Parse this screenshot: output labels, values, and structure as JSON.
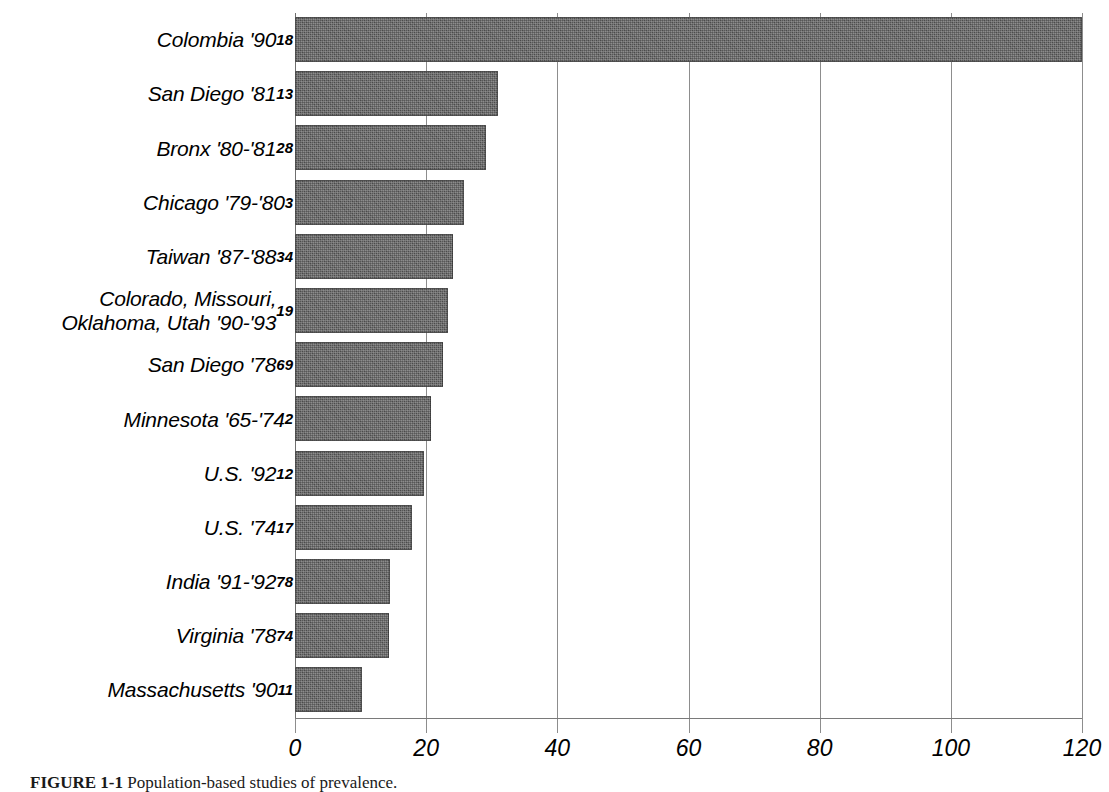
{
  "figure": {
    "caption_label": "FIGURE 1-1",
    "caption_text": "Population-based studies of prevalence."
  },
  "axis": {
    "tick_labels": [
      "0",
      "20",
      "40",
      "60",
      "80",
      "100",
      "120"
    ],
    "tick_values": [
      0,
      20,
      40,
      60,
      80,
      100,
      120
    ],
    "xlabel": ""
  },
  "colors": {
    "bar_fill": "#585858",
    "gridline": "#8d8d8d",
    "axis": "#7a7a7a",
    "text": "#000000",
    "background": "#ffffff"
  },
  "chart_data": {
    "type": "bar",
    "orientation": "horizontal",
    "title": "",
    "xlabel": "",
    "ylabel": "",
    "xlim": [
      0,
      120
    ],
    "grid": true,
    "legend": "none",
    "categories": [
      "Colombia '90",
      "San Diego '81",
      "Bronx '80-'81",
      "Chicago '79-'80",
      "Taiwan '87-'88",
      "Colorado, Missouri,\nOklahoma, Utah '90-'93",
      "San Diego '78",
      "Minnesota '65-'74",
      "U.S. '92",
      "U.S. '74",
      "India '91-'92",
      "Virginia '78",
      "Massachusetts '90"
    ],
    "reference_superscripts": [
      "18",
      "13",
      "28",
      "3",
      "34",
      "19",
      "69",
      "2",
      "12",
      "17",
      "78",
      "74",
      "11"
    ],
    "values": [
      120,
      30.9,
      29.1,
      25.7,
      24.1,
      23.4,
      22.6,
      20.8,
      19.7,
      17.8,
      14.5,
      14.3,
      10.2
    ]
  },
  "rows": [
    {
      "label": "Colombia '90",
      "sup": "18",
      "value": 120
    },
    {
      "label": "San Diego '81",
      "sup": "13",
      "value": 30.9
    },
    {
      "label": "Bronx '80-'81",
      "sup": "28",
      "value": 29.1
    },
    {
      "label": "Chicago '79-'80",
      "sup": "3",
      "value": 25.7
    },
    {
      "label": "Taiwan '87-'88",
      "sup": "34",
      "value": 24.1
    },
    {
      "label": "Colorado, Missouri,\nOklahoma, Utah '90-'93",
      "sup": "19",
      "value": 23.4
    },
    {
      "label": "San Diego '78",
      "sup": "69",
      "value": 22.6
    },
    {
      "label": "Minnesota '65-'74",
      "sup": "2",
      "value": 20.8
    },
    {
      "label": "U.S. '92",
      "sup": "12",
      "value": 19.7
    },
    {
      "label": "U.S. '74",
      "sup": "17",
      "value": 17.8
    },
    {
      "label": "India '91-'92",
      "sup": "78",
      "value": 14.5
    },
    {
      "label": "Virginia '78",
      "sup": "74",
      "value": 14.3
    },
    {
      "label": "Massachusetts '90",
      "sup": "11",
      "value": 10.2
    }
  ]
}
